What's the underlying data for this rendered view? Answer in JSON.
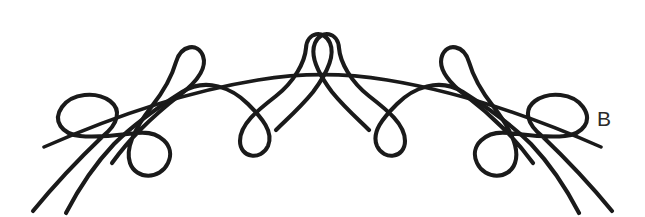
{
  "figure": {
    "label": "B",
    "background_color": "#ffffff",
    "stroke_color": "#1a1a1a",
    "label_color": "#2b2b2b",
    "canvas": {
      "width": 645,
      "height": 217
    },
    "loops": [
      {
        "name": "loop-left-end",
        "cx": 72,
        "cy": 122,
        "orientation": "left"
      },
      {
        "name": "loop-left-lower",
        "cx": 161,
        "cy": 159,
        "orientation": "down"
      },
      {
        "name": "loop-left-upper",
        "cx": 186,
        "cy": 48,
        "orientation": "up"
      },
      {
        "name": "loop-inner-left",
        "cx": 265,
        "cy": 128,
        "orientation": "down"
      },
      {
        "name": "loop-center-top",
        "cx": 318,
        "cy": 40,
        "orientation": "up"
      },
      {
        "name": "loop-inner-right",
        "cx": 378,
        "cy": 128,
        "orientation": "down"
      },
      {
        "name": "loop-right-upper",
        "cx": 444,
        "cy": 48,
        "orientation": "up"
      },
      {
        "name": "loop-right-lower",
        "cx": 469,
        "cy": 159,
        "orientation": "down"
      },
      {
        "name": "loop-right-end",
        "cx": 556,
        "cy": 117,
        "orientation": "right"
      }
    ],
    "tails": [
      {
        "name": "tail-lower-left-outer",
        "from": [
          103,
          150
        ],
        "to": [
          33,
          211
        ]
      },
      {
        "name": "tail-lower-left-inner",
        "from": [
          56,
          150
        ],
        "to": [
          66,
          213
        ]
      },
      {
        "name": "tail-lower-right-outer",
        "from": [
          525,
          150
        ],
        "to": [
          596,
          211
        ]
      },
      {
        "name": "tail-lower-right-inner",
        "from": [
          572,
          150
        ],
        "to": [
          562,
          213
        ]
      }
    ]
  }
}
